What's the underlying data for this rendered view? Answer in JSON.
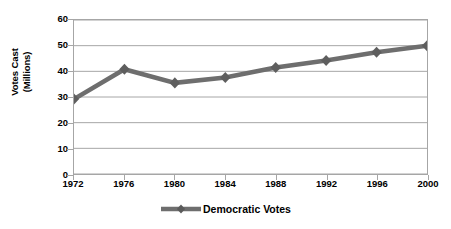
{
  "chart_data": {
    "type": "line",
    "title": "",
    "xlabel": "",
    "ylabel": "Votes Cast (Millions)",
    "ylabel_lines": [
      "Votes Cast",
      "(Millions)"
    ],
    "categories": [
      "1972",
      "1976",
      "1980",
      "1984",
      "1988",
      "1992",
      "1996",
      "2000"
    ],
    "series": [
      {
        "name": "Democratic Votes",
        "values": [
          29.2,
          40.8,
          35.5,
          37.6,
          41.5,
          44.2,
          47.4,
          50.0
        ],
        "color": "#6e6e6e",
        "marker": "diamond"
      }
    ],
    "ylim": [
      0,
      60
    ],
    "yticks": [
      "0",
      "10",
      "20",
      "30",
      "40",
      "50",
      "60"
    ],
    "ytick_values": [
      0,
      10,
      20,
      30,
      40,
      50,
      60
    ],
    "grid": "horizontal",
    "legend_position": "bottom-center",
    "plot_border": true,
    "background_color": "#ffffff",
    "gridline_color": "#a6a6a6",
    "text_color": "#000000"
  },
  "legend": {
    "entries": [
      {
        "label": "Democratic Votes",
        "color": "#6e6e6e"
      }
    ]
  }
}
